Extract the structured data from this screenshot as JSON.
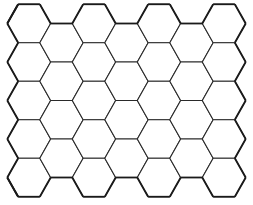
{
  "diagram": {
    "type": "hexagonal-grid",
    "orientation": "flat-top",
    "columns": 7,
    "rows_even_columns": 5,
    "rows_odd_columns": 4,
    "odd_columns_offset": "down-half",
    "hex_side": 21.7,
    "origin_center": [
      29,
      23.5
    ],
    "column_pitch": 32.5,
    "row_pitch": 38.5,
    "stroke_color": "#2a2a2a",
    "border_color": "#1a1a1a",
    "fill_color": "#ffffff",
    "background": "#ffffff",
    "labels": []
  }
}
